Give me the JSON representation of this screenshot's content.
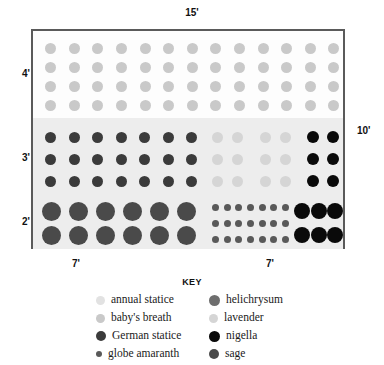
{
  "chart_data": {
    "type": "diagram",
    "dimensions": {
      "top_label": "15'",
      "right_label": "10'",
      "left_labels": [
        "4'",
        "3'",
        "2'"
      ],
      "bottom_labels": [
        "7'",
        "7'"
      ]
    },
    "colors": {
      "annual_statice": "#e2e2e2",
      "babys_breath": "#c9c9c9",
      "german_statice": "#3b3b3b",
      "globe_amaranth": "#595959",
      "helichrysum": "#6e6e6e",
      "lavender": "#d5d5d5",
      "nigella": "#0a0a0a",
      "sage": "#4a4a4a",
      "bed_border": "#5a5a5a",
      "band_top": "#fdfdfd",
      "band_shaded": "#ededed"
    },
    "plant_groups": [
      {
        "name": "babys_breath",
        "species": "baby's breath",
        "rows": 4,
        "cols": 13,
        "count": 52,
        "dot_px": 11,
        "color": "#c9c9c9",
        "section": "top-band"
      },
      {
        "name": "german_statice",
        "species": "German statice",
        "rows": 3,
        "cols": 7,
        "count": 21,
        "dot_px": 11,
        "color": "#3b3b3b",
        "section": "middle-band-left"
      },
      {
        "name": "lavender_a",
        "species": "lavender",
        "rows": 3,
        "cols": 2,
        "count": 6,
        "dot_px": 11,
        "color": "#d5d5d5",
        "section": "middle-band-right"
      },
      {
        "name": "lavender_b",
        "species": "lavender",
        "rows": 3,
        "cols": 2,
        "count": 6,
        "dot_px": 11,
        "color": "#d5d5d5",
        "section": "middle-band-right"
      },
      {
        "name": "nigella_mid",
        "species": "nigella",
        "rows": 3,
        "cols": 2,
        "count": 6,
        "dot_px": 12,
        "color": "#0a0a0a",
        "section": "middle-band-right"
      },
      {
        "name": "sage",
        "species": "sage",
        "rows": 2,
        "cols": 6,
        "count": 12,
        "dot_px": 19,
        "color": "#4a4a4a",
        "section": "bottom-band-left"
      },
      {
        "name": "globe_amaranth",
        "species": "globe amaranth",
        "rows": 3,
        "cols": 7,
        "count": 21,
        "dot_px": 7,
        "color": "#595959",
        "section": "bottom-band-right"
      },
      {
        "name": "nigella_bottom",
        "species": "nigella",
        "rows": 2,
        "cols": 3,
        "count": 6,
        "dot_px": 16,
        "color": "#0a0a0a",
        "section": "bottom-band-right"
      }
    ]
  },
  "dimensions": {
    "top": "15'",
    "right": "10'",
    "left_upper": "4'",
    "left_middle": "3'",
    "left_lower": "2'",
    "bottom_left": "7'",
    "bottom_right": "7'"
  },
  "key": {
    "title": "KEY",
    "items": [
      {
        "label": "annual statice",
        "color": "#e2e2e2",
        "size": 9,
        "column": "left"
      },
      {
        "label": "baby's breath",
        "color": "#c9c9c9",
        "size": 9,
        "column": "left"
      },
      {
        "label": "German statice",
        "color": "#3b3b3b",
        "size": 10,
        "column": "left"
      },
      {
        "label": "globe amaranth",
        "color": "#595959",
        "size": 6,
        "column": "left"
      },
      {
        "label": "helichrysum",
        "color": "#6e6e6e",
        "size": 11,
        "column": "right"
      },
      {
        "label": "lavender",
        "color": "#d5d5d5",
        "size": 9,
        "column": "right"
      },
      {
        "label": "nigella",
        "color": "#0a0a0a",
        "size": 11,
        "column": "right"
      },
      {
        "label": "sage",
        "color": "#4a4a4a",
        "size": 10,
        "column": "right"
      }
    ]
  }
}
